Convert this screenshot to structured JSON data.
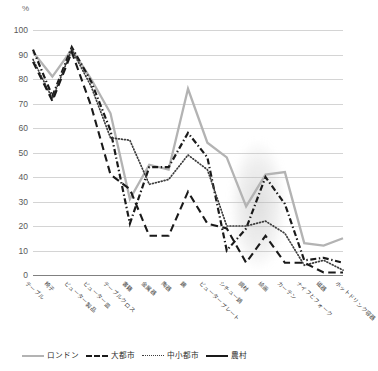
{
  "axis": {
    "unit_label": "%",
    "y_ticks": [
      0,
      10,
      20,
      30,
      40,
      50,
      60,
      70,
      80,
      90,
      100
    ]
  },
  "legend": {
    "items": [
      {
        "label": "ロンドン",
        "style": "solid",
        "color": "#b3b3b3"
      },
      {
        "label": "大都市",
        "style": "dash-dot",
        "color": "#1a1a1a"
      },
      {
        "label": "中小都市",
        "style": "dotted",
        "color": "#3d3d3d"
      },
      {
        "label": "農村",
        "style": "long-dash",
        "color": "#1a1a1a"
      }
    ]
  },
  "chart_data": {
    "type": "line",
    "title": "",
    "xlabel": "",
    "ylabel": "%",
    "ylim": [
      0,
      100
    ],
    "grid": true,
    "legend_position": "bottom",
    "categories": [
      "テーブル",
      "椅子",
      "ビューター製品",
      "ビューター皿",
      "テーブルクロス",
      "書籍",
      "金属器",
      "陶器",
      "鏡",
      "ビュータープレート",
      "シチュー鍋",
      "調材",
      "絵画",
      "カーテン",
      "ナイフとフォーク",
      "磁器",
      "ホットドリンク容器"
    ],
    "series": [
      {
        "name": "ロンドン",
        "color": "#b3b3b3",
        "style": "solid",
        "values": [
          91,
          81,
          92,
          80,
          66,
          31,
          45,
          43,
          76,
          54,
          48,
          28,
          41,
          42,
          13,
          12,
          15
        ]
      },
      {
        "name": "大都市",
        "color": "#1a1a1a",
        "style": "dash-dot",
        "values": [
          92,
          73,
          93,
          79,
          59,
          21,
          44,
          44,
          58,
          48,
          10,
          19,
          40,
          29,
          6,
          7,
          5
        ]
      },
      {
        "name": "中小都市",
        "color": "#3d3d3d",
        "style": "dotted",
        "values": [
          88,
          72,
          92,
          77,
          56,
          55,
          37,
          39,
          49,
          43,
          20,
          20,
          22,
          17,
          4,
          6,
          2
        ]
      },
      {
        "name": "農村",
        "color": "#1a1a1a",
        "style": "long-dash",
        "values": [
          87,
          71,
          91,
          69,
          41,
          35,
          16,
          16,
          34,
          21,
          19,
          5,
          16,
          5,
          5,
          1,
          1
        ]
      }
    ]
  }
}
